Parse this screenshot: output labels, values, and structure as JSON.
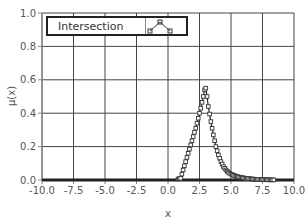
{
  "chart_data": {
    "type": "scatter",
    "title": "",
    "xlabel": "x",
    "ylabel": "μ(x)",
    "xlim": [
      -10.0,
      10.0
    ],
    "ylim": [
      0.0,
      1.0
    ],
    "grid": true,
    "legend_position": "top-left (inside)",
    "x_ticks": [
      "-10.0",
      "-7.5",
      "-5.0",
      "-2.5",
      "0.0",
      "2.5",
      "5.0",
      "7.5",
      "10.0"
    ],
    "y_ticks": [
      "0.0",
      "0.2",
      "0.4",
      "0.6",
      "0.8",
      "1.0"
    ],
    "series": [
      {
        "name": "Intersection",
        "marker": "square",
        "line": true,
        "x": [
          -10.0,
          -9.0,
          -8.0,
          -7.0,
          -6.0,
          -5.0,
          -4.0,
          -3.0,
          -2.0,
          -1.0,
          0.0,
          0.5,
          1.0,
          1.2,
          1.4,
          1.6,
          1.8,
          2.0,
          2.2,
          2.4,
          2.6,
          2.8,
          2.9,
          3.0,
          3.1,
          3.2,
          3.4,
          3.6,
          3.8,
          4.0,
          4.2,
          4.4,
          4.6,
          4.8,
          5.0,
          5.3,
          5.6,
          6.0,
          6.5,
          7.0,
          7.5,
          8.0,
          9.0,
          10.0
        ],
        "values": [
          0.0,
          0.0,
          0.0,
          0.0,
          0.0,
          0.0,
          0.0,
          0.0,
          0.0,
          0.0,
          0.0,
          0.0,
          0.01,
          0.06,
          0.11,
          0.16,
          0.21,
          0.26,
          0.31,
          0.37,
          0.43,
          0.5,
          0.54,
          0.55,
          0.5,
          0.44,
          0.35,
          0.27,
          0.2,
          0.15,
          0.11,
          0.08,
          0.06,
          0.045,
          0.035,
          0.025,
          0.018,
          0.012,
          0.007,
          0.004,
          0.002,
          0.001,
          0.0,
          0.0
        ]
      }
    ]
  },
  "legend": {
    "label": "Intersection",
    "icon": "line-with-square-markers-icon"
  },
  "axes": {
    "x_title": "x",
    "y_title": "μ(x)"
  }
}
